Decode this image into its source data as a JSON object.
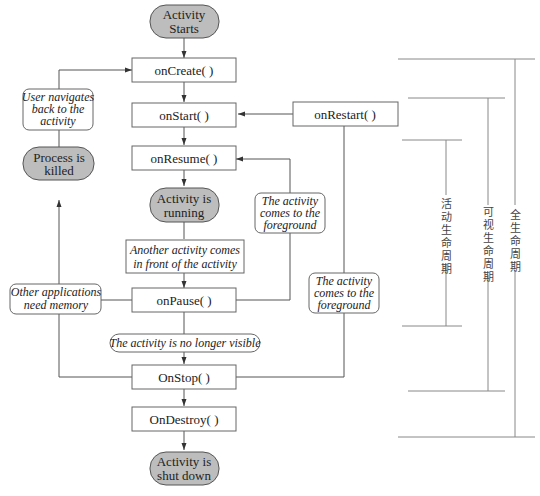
{
  "diagram": {
    "terminals": {
      "start": [
        "Activity",
        "Starts"
      ],
      "running": [
        "Activity is",
        "running"
      ],
      "killed": [
        "Process is",
        "killed"
      ],
      "shutdown": [
        "Activity is",
        "shut down"
      ]
    },
    "methods": {
      "on_create": "onCreate( )",
      "on_start": "onStart( )",
      "on_restart": "onRestart( )",
      "on_resume": "onResume( )",
      "on_pause": "onPause( )",
      "on_stop": "OnStop( )",
      "on_destroy": "OnDestroy( )"
    },
    "notes": {
      "user_navigates": [
        "User navigates",
        "back to the",
        "activity"
      ],
      "foreground_1": [
        "The activity",
        "comes to the",
        "foreground"
      ],
      "another_activity": [
        "Another activity comes",
        "in front of the activity"
      ],
      "other_apps": [
        "Other applications",
        "need memory"
      ],
      "no_longer_visible": "The activity is no longer visible",
      "foreground_2": [
        "The activity",
        "comes to the",
        "foreground"
      ]
    },
    "lifetimes": {
      "foreground": [
        "活",
        "动",
        "生",
        "命",
        "周",
        "期"
      ],
      "visible": [
        "可",
        "视",
        "生",
        "命",
        "周",
        "期"
      ],
      "entire": [
        "全",
        "生",
        "命",
        "周",
        "期"
      ]
    }
  }
}
